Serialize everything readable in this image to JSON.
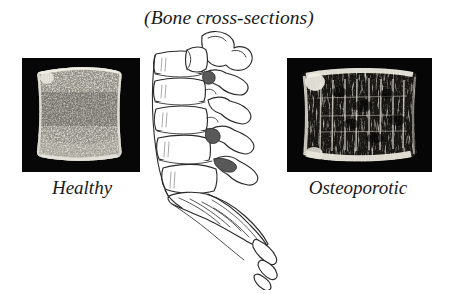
{
  "figure": {
    "title": "(Bone cross-sections)",
    "background_color": "#ffffff",
    "ink_color": "#1a1a1a",
    "width": 458,
    "height": 294
  },
  "panels": [
    {
      "id": "healthy",
      "label": "Healthy",
      "kind": "radiograph",
      "subject": "vertebral-body-cross-section",
      "background_color": "#000000",
      "bone_color": "#d8d5cc",
      "description": "Dense fine trabecular bone filling the entire vertebral body",
      "trabecular_density": "dense",
      "x": 22,
      "y": 58,
      "width": 118,
      "height": 114
    },
    {
      "id": "osteoporotic",
      "label": "Osteoporotic",
      "kind": "radiograph",
      "subject": "vertebral-body-cross-section",
      "background_color": "#000000",
      "bone_color": "#d8d5cc",
      "description": "Sparse coarse vertical trabeculae with large voids and thickened end plates",
      "trabecular_density": "sparse",
      "x": 287,
      "y": 58,
      "width": 145,
      "height": 114
    }
  ],
  "spine": {
    "name": "lumbar-spine-lateral-view",
    "label": "",
    "stroke_color": "#2a2a2a",
    "fill_color": "#ffffff",
    "parts": [
      "vertebral-bodies",
      "intervertebral-discs",
      "spinous-processes",
      "facet-joints",
      "sacrum",
      "coccyx"
    ]
  }
}
